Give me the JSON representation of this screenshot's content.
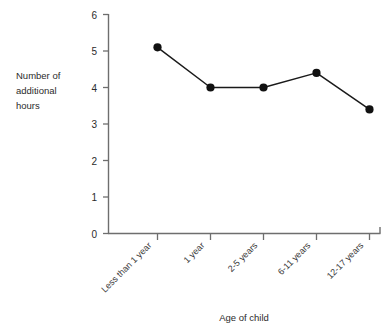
{
  "chart_data": {
    "type": "line",
    "title": "",
    "xlabel": "Age of child",
    "ylabel": "Number of additional hours",
    "ylabel_lines": [
      "Number of",
      "additional",
      "hours"
    ],
    "categories": [
      "Less than 1 year",
      "1 year",
      "2-5 years",
      "6-11 years",
      "12-17 years"
    ],
    "values": [
      5.1,
      4.0,
      4.0,
      4.4,
      3.4
    ],
    "series": [
      {
        "name": "Number of additional hours",
        "values": [
          5.1,
          4.0,
          4.0,
          4.4,
          3.4
        ]
      }
    ],
    "ylim": [
      0,
      6
    ],
    "yticks": [
      0,
      1,
      2,
      3,
      4,
      5,
      6
    ],
    "ytick_labels": [
      "0",
      "1",
      "2",
      "3",
      "4",
      "5",
      "6"
    ],
    "grid": false,
    "legend": false,
    "legend_position": "none",
    "marker": "filled-circle",
    "line_color": "#1a1a1a",
    "marker_color": "#111111",
    "axis_color": "#6e6e6e",
    "background_color": "#ffffff",
    "xtick_label_rotation": -45
  }
}
